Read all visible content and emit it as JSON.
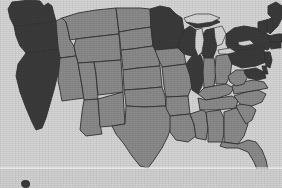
{
  "map": {
    "title": "United States choropleth map",
    "type": "choropleth",
    "region": "United States (contiguous 48 states)",
    "projection": "albers-usa",
    "background_color": "#d6d6d6",
    "border_color": "#333333",
    "categories": [
      {
        "key": "highlighted",
        "color": "#3b3b3b",
        "label": ""
      },
      {
        "key": "base",
        "color": "#8b8b8b",
        "label": ""
      }
    ],
    "states": [
      {
        "code": "WA",
        "name": "Washington",
        "category": "highlighted",
        "color": "#3b3b3b"
      },
      {
        "code": "OR",
        "name": "Oregon",
        "category": "highlighted",
        "color": "#3b3b3b"
      },
      {
        "code": "CA",
        "name": "California",
        "category": "highlighted",
        "color": "#3b3b3b"
      },
      {
        "code": "ID",
        "name": "Idaho",
        "category": "base",
        "color": "#8b8b8b"
      },
      {
        "code": "NV",
        "name": "Nevada",
        "category": "base",
        "color": "#8b8b8b"
      },
      {
        "code": "MT",
        "name": "Montana",
        "category": "base",
        "color": "#8b8b8b"
      },
      {
        "code": "WY",
        "name": "Wyoming",
        "category": "base",
        "color": "#8b8b8b"
      },
      {
        "code": "UT",
        "name": "Utah",
        "category": "base",
        "color": "#8b8b8b"
      },
      {
        "code": "AZ",
        "name": "Arizona",
        "category": "base",
        "color": "#8b8b8b"
      },
      {
        "code": "CO",
        "name": "Colorado",
        "category": "base",
        "color": "#8b8b8b"
      },
      {
        "code": "NM",
        "name": "New Mexico",
        "category": "base",
        "color": "#8b8b8b"
      },
      {
        "code": "ND",
        "name": "North Dakota",
        "category": "base",
        "color": "#8b8b8b"
      },
      {
        "code": "SD",
        "name": "South Dakota",
        "category": "base",
        "color": "#8b8b8b"
      },
      {
        "code": "NE",
        "name": "Nebraska",
        "category": "base",
        "color": "#8b8b8b"
      },
      {
        "code": "KS",
        "name": "Kansas",
        "category": "base",
        "color": "#8b8b8b"
      },
      {
        "code": "OK",
        "name": "Oklahoma",
        "category": "base",
        "color": "#8b8b8b"
      },
      {
        "code": "TX",
        "name": "Texas",
        "category": "base",
        "color": "#8b8b8b"
      },
      {
        "code": "MN",
        "name": "Minnesota",
        "category": "highlighted",
        "color": "#3b3b3b"
      },
      {
        "code": "IA",
        "name": "Iowa",
        "category": "base",
        "color": "#8b8b8b"
      },
      {
        "code": "MO",
        "name": "Missouri",
        "category": "base",
        "color": "#8b8b8b"
      },
      {
        "code": "AR",
        "name": "Arkansas",
        "category": "base",
        "color": "#8b8b8b"
      },
      {
        "code": "LA",
        "name": "Louisiana",
        "category": "base",
        "color": "#8b8b8b"
      },
      {
        "code": "WI",
        "name": "Wisconsin",
        "category": "highlighted",
        "color": "#3b3b3b"
      },
      {
        "code": "MI",
        "name": "Michigan",
        "category": "highlighted",
        "color": "#3b3b3b"
      },
      {
        "code": "IL",
        "name": "Illinois",
        "category": "highlighted",
        "color": "#3b3b3b"
      },
      {
        "code": "IN",
        "name": "Indiana",
        "category": "base",
        "color": "#8b8b8b"
      },
      {
        "code": "OH",
        "name": "Ohio",
        "category": "base",
        "color": "#8b8b8b"
      },
      {
        "code": "KY",
        "name": "Kentucky",
        "category": "base",
        "color": "#8b8b8b"
      },
      {
        "code": "TN",
        "name": "Tennessee",
        "category": "base",
        "color": "#8b8b8b"
      },
      {
        "code": "MS",
        "name": "Mississippi",
        "category": "base",
        "color": "#8b8b8b"
      },
      {
        "code": "AL",
        "name": "Alabama",
        "category": "base",
        "color": "#8b8b8b"
      },
      {
        "code": "GA",
        "name": "Georgia",
        "category": "base",
        "color": "#8b8b8b"
      },
      {
        "code": "FL",
        "name": "Florida",
        "category": "base",
        "color": "#8b8b8b"
      },
      {
        "code": "SC",
        "name": "South Carolina",
        "category": "base",
        "color": "#8b8b8b"
      },
      {
        "code": "NC",
        "name": "North Carolina",
        "category": "base",
        "color": "#8b8b8b"
      },
      {
        "code": "VA",
        "name": "Virginia",
        "category": "base",
        "color": "#8b8b8b"
      },
      {
        "code": "WV",
        "name": "West Virginia",
        "category": "base",
        "color": "#8b8b8b"
      },
      {
        "code": "MD",
        "name": "Maryland",
        "category": "highlighted",
        "color": "#3b3b3b"
      },
      {
        "code": "DE",
        "name": "Delaware",
        "category": "highlighted",
        "color": "#3b3b3b"
      },
      {
        "code": "PA",
        "name": "Pennsylvania",
        "category": "highlighted",
        "color": "#3b3b3b"
      },
      {
        "code": "NJ",
        "name": "New Jersey",
        "category": "highlighted",
        "color": "#3b3b3b"
      },
      {
        "code": "NY",
        "name": "New York",
        "category": "highlighted",
        "color": "#3b3b3b"
      },
      {
        "code": "CT",
        "name": "Connecticut",
        "category": "highlighted",
        "color": "#3b3b3b"
      },
      {
        "code": "RI",
        "name": "Rhode Island",
        "category": "highlighted",
        "color": "#3b3b3b"
      },
      {
        "code": "MA",
        "name": "Massachusetts",
        "category": "highlighted",
        "color": "#3b3b3b"
      },
      {
        "code": "VT",
        "name": "Vermont",
        "category": "highlighted",
        "color": "#3b3b3b"
      },
      {
        "code": "NH",
        "name": "New Hampshire",
        "category": "highlighted",
        "color": "#3b3b3b"
      },
      {
        "code": "ME",
        "name": "Maine",
        "category": "highlighted",
        "color": "#3b3b3b"
      }
    ],
    "water_features": [
      {
        "name": "Lake Superior"
      },
      {
        "name": "Lake Michigan"
      },
      {
        "name": "Lake Huron"
      },
      {
        "name": "Lake Erie"
      },
      {
        "name": "Lake Ontario"
      }
    ]
  },
  "lower_panel": {
    "divider_visible": true,
    "inset_marker_visible": true
  }
}
